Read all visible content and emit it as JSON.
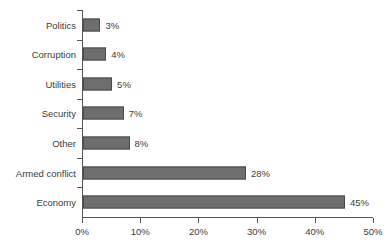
{
  "chart_data": {
    "type": "bar",
    "orientation": "horizontal",
    "title": "",
    "subtitle": "",
    "xlabel": "",
    "ylabel": "",
    "categories": [
      "Economy",
      "Armed conflict",
      "Other",
      "Security",
      "Utilities",
      "Corruption",
      "Politics"
    ],
    "values": [
      45,
      28,
      8,
      7,
      5,
      4,
      3
    ],
    "value_labels": [
      "45%",
      "28%",
      "8%",
      "7%",
      "5%",
      "4%",
      "3%"
    ],
    "xlim": [
      0,
      50
    ],
    "xticks": [
      0,
      10,
      20,
      30,
      40,
      50
    ],
    "xtick_labels": [
      "0%",
      "10%",
      "20%",
      "30%",
      "40%",
      "50%"
    ],
    "grid": false,
    "legend": null,
    "legend_position": "none",
    "bar_color": "#6e6e6e",
    "bar_border_color": "#4a4a4a",
    "axis_color": "#555555",
    "text_color": "#3c3c3c",
    "background_color": "#ffffff",
    "display_order_top_to_bottom": [
      "Politics",
      "Corruption",
      "Utilities",
      "Security",
      "Other",
      "Armed conflict",
      "Economy"
    ]
  },
  "rows": [
    {
      "label": "Politics",
      "value": 3,
      "value_label": "3%"
    },
    {
      "label": "Corruption",
      "value": 4,
      "value_label": "4%"
    },
    {
      "label": "Utilities",
      "value": 5,
      "value_label": "5%"
    },
    {
      "label": "Security",
      "value": 7,
      "value_label": "7%"
    },
    {
      "label": "Other",
      "value": 8,
      "value_label": "8%"
    },
    {
      "label": "Armed conflict",
      "value": 28,
      "value_label": "28%"
    },
    {
      "label": "Economy",
      "value": 45,
      "value_label": "45%"
    }
  ],
  "xaxis": {
    "ticks": [
      {
        "label": "0%",
        "value": 0
      },
      {
        "label": "10%",
        "value": 10
      },
      {
        "label": "20%",
        "value": 20
      },
      {
        "label": "30%",
        "value": 30
      },
      {
        "label": "40%",
        "value": 40
      },
      {
        "label": "50%",
        "value": 50
      }
    ]
  }
}
